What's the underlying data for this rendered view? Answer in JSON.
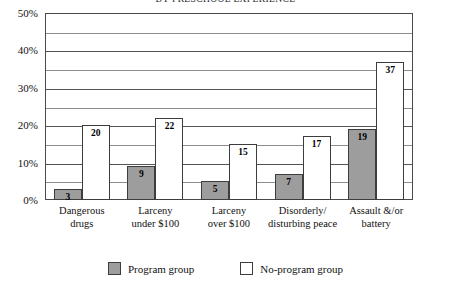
{
  "chart_data": {
    "type": "bar",
    "title": "BY PRESCHOOL EXPERIENCE",
    "xlabel": "",
    "ylabel": "",
    "ylim": [
      0,
      50
    ],
    "y_tick_step": 10,
    "y_minor_step": 5,
    "grid": true,
    "legend_position": "bottom",
    "value_suffix": "%",
    "categories": [
      "Dangerous\ndrugs",
      "Larceny\nunder $100",
      "Larceny\nover $100",
      "Disorderly/\ndisturbing peace",
      "Assault &/or\nbattery"
    ],
    "category_lines": [
      [
        "Dangerous",
        "drugs"
      ],
      [
        "Larceny",
        "under $100"
      ],
      [
        "Larceny",
        "over $100"
      ],
      [
        "Disorderly/",
        "disturbing peace"
      ],
      [
        "Assault &/or",
        "battery"
      ]
    ],
    "y_ticks": [
      "0%",
      "10%",
      "20%",
      "30%",
      "40%",
      "50%"
    ],
    "y_tick_values": [
      0,
      10,
      20,
      30,
      40,
      50
    ],
    "series": [
      {
        "name": "Program group",
        "color": "#9d9d9d",
        "values": [
          3,
          9,
          5,
          7,
          19
        ],
        "labels": [
          "3",
          "9",
          "5",
          "7",
          "19"
        ]
      },
      {
        "name": "No-program group",
        "color": "#ffffff",
        "values": [
          20,
          22,
          15,
          17,
          37
        ],
        "labels": [
          "20",
          "22",
          "15",
          "17",
          "37"
        ]
      }
    ]
  },
  "legend": {
    "items": [
      {
        "label": "Program group",
        "swatch": "program"
      },
      {
        "label": "No-program group",
        "swatch": "noprogram"
      }
    ]
  },
  "colors": {
    "program_fill": "#9d9d9d",
    "noprogram_fill": "#ffffff",
    "axis": "#4a4a4a",
    "gridline": "#555555",
    "text": "#111111"
  }
}
